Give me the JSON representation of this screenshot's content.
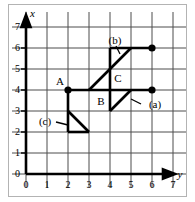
{
  "figure": {
    "axes": {
      "vertical_axis_label": "x",
      "horizontal_axis_label": "y",
      "origin_label": "0",
      "vertical_ticks": [
        "0",
        "1",
        "2",
        "3",
        "4",
        "5",
        "6",
        "7"
      ],
      "horizontal_ticks": [
        "0",
        "1",
        "2",
        "3",
        "4",
        "5",
        "6",
        "7"
      ],
      "x_range": [
        0,
        7.6
      ],
      "y_range": [
        0,
        7.6
      ]
    },
    "grid": {
      "visible": true,
      "spacing": 1,
      "color": "#4d4d4d"
    },
    "point_labels": [
      {
        "name": "A",
        "text": "A",
        "at": [
          2,
          4
        ],
        "anchor": "upper-left"
      },
      {
        "name": "B",
        "text": "B",
        "at": [
          4,
          4
        ],
        "anchor": "lower-left"
      },
      {
        "name": "C",
        "text": "C",
        "at": [
          4,
          5
        ],
        "anchor": "lower-right"
      }
    ],
    "callouts": [
      {
        "name": "a",
        "text": "(a)",
        "points_to": [
          4.7,
          3.7
        ]
      },
      {
        "name": "b",
        "text": "(b)",
        "points_to": [
          4.5,
          6.0
        ]
      },
      {
        "name": "c",
        "text": "(c)",
        "points_to": [
          2.6,
          2.5
        ]
      }
    ],
    "markers": [
      {
        "at": [
          2,
          4
        ]
      },
      {
        "at": [
          6,
          6
        ]
      },
      {
        "at": [
          6,
          4
        ]
      }
    ],
    "segments": [
      {
        "name": "top-horizontal",
        "from": [
          4,
          6
        ],
        "to": [
          6,
          6
        ]
      },
      {
        "name": "mid-horizontal",
        "from": [
          2,
          4
        ],
        "to": [
          6,
          4
        ]
      },
      {
        "name": "vertical-4",
        "from": [
          4,
          3
        ],
        "to": [
          4,
          6
        ]
      },
      {
        "name": "vertical-2",
        "from": [
          2,
          2
        ],
        "to": [
          2,
          4
        ]
      },
      {
        "name": "bottom-horizontal",
        "from": [
          2,
          2
        ],
        "to": [
          3,
          2
        ]
      },
      {
        "name": "diagonal-long",
        "from": [
          3,
          4
        ],
        "to": [
          5,
          6
        ]
      },
      {
        "name": "diagonal-lower",
        "from": [
          4,
          3
        ],
        "to": [
          5,
          4
        ]
      },
      {
        "name": "diagonal-c",
        "from": [
          2,
          3
        ],
        "to": [
          3,
          2
        ]
      }
    ],
    "colors": {
      "grid": "#4d4d4d",
      "axis": "#000000",
      "figure": "#000000",
      "background": "#ffffff",
      "border": "#b3b3b3"
    }
  }
}
